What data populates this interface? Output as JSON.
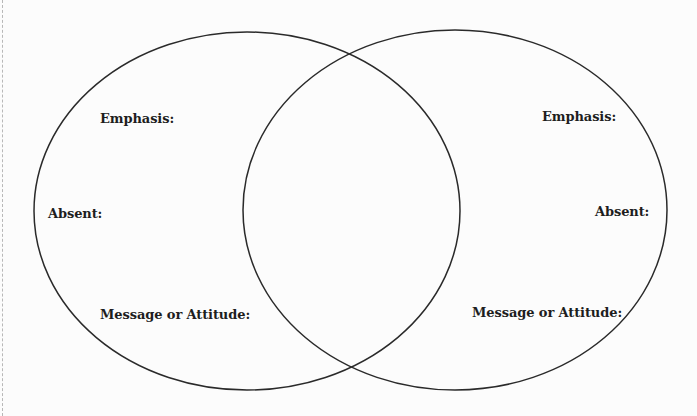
{
  "diagram": {
    "type": "venn",
    "stroke_color": "#2a2a2a",
    "background": "#fcfcfc",
    "circles": [
      {
        "id": "left",
        "cx": 247,
        "cy": 211,
        "rx": 213,
        "ry": 179,
        "labels": {
          "emphasis": "Emphasis:",
          "absent": "Absent:",
          "message": "Message or Attitude:"
        }
      },
      {
        "id": "right",
        "cx": 455,
        "cy": 210,
        "rx": 212,
        "ry": 180,
        "labels": {
          "emphasis": "Emphasis:",
          "absent": "Absent:",
          "message": "Message or Attitude:"
        }
      }
    ]
  }
}
